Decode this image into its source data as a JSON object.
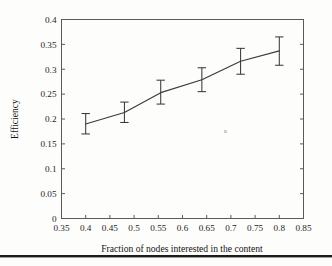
{
  "chart_data": {
    "type": "line",
    "title": "",
    "subtitle": "",
    "xlabel": "Fraction of nodes interested in the content",
    "ylabel": "Efficiency",
    "xlim": [
      0.35,
      0.85
    ],
    "ylim": [
      0,
      0.4
    ],
    "grid": false,
    "legend": "none",
    "x_ticks": [
      "0.35",
      "0.4",
      "0.45",
      "0.5",
      "0.55",
      "0.6",
      "0.65",
      "0.7",
      "0.75",
      "0.8",
      "0.85"
    ],
    "x_tick_values": [
      0.35,
      0.4,
      0.45,
      0.5,
      0.55,
      0.6,
      0.65,
      0.7,
      0.75,
      0.8,
      0.85
    ],
    "y_ticks": [
      "0",
      "0.05",
      "0.1",
      "0.15",
      "0.2",
      "0.25",
      "0.3",
      "0.35",
      "0.4"
    ],
    "y_tick_values": [
      0,
      0.05,
      0.1,
      0.15,
      0.2,
      0.25,
      0.3,
      0.35,
      0.4
    ],
    "x": [
      0.4,
      0.48,
      0.555,
      0.64,
      0.72,
      0.8
    ],
    "values": [
      0.19,
      0.213,
      0.253,
      0.279,
      0.316,
      0.337
    ],
    "yerr_lower": [
      0.02,
      0.02,
      0.023,
      0.024,
      0.026,
      0.029
    ],
    "yerr_upper": [
      0.021,
      0.021,
      0.025,
      0.024,
      0.026,
      0.028
    ],
    "series": [
      {
        "name": "Efficiency",
        "marker": "none",
        "line_color": "#3a3a3a",
        "errorbar_color": "#3a3a3a",
        "points": [
          {
            "x": 0.4,
            "y": 0.19,
            "low": 0.17,
            "high": 0.211
          },
          {
            "x": 0.48,
            "y": 0.213,
            "low": 0.193,
            "high": 0.234
          },
          {
            "x": 0.555,
            "y": 0.253,
            "low": 0.23,
            "high": 0.278
          },
          {
            "x": 0.64,
            "y": 0.279,
            "low": 0.255,
            "high": 0.303
          },
          {
            "x": 0.72,
            "y": 0.316,
            "low": 0.29,
            "high": 0.342
          },
          {
            "x": 0.8,
            "y": 0.337,
            "low": 0.308,
            "high": 0.365
          }
        ]
      }
    ]
  },
  "figure": {
    "background_color": "#fdfdfc",
    "axis_color": "#5a5a5a",
    "text_color": "#1a1a1a"
  }
}
